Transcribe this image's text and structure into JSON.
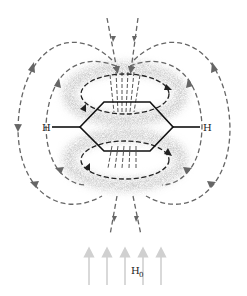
{
  "diagram": {
    "labels": {
      "hydrogen_left": "H",
      "hydrogen_right": "H",
      "field_label": "H",
      "field_subscript": "0"
    },
    "colors": {
      "field_lines": "#666666",
      "ring_current": "#222222",
      "ring_bonds": "#111111",
      "electron_cloud": "#9a9a9a",
      "applied_field_arrows": "#d0d0d0"
    },
    "applied_field_arrow_count": 5
  }
}
